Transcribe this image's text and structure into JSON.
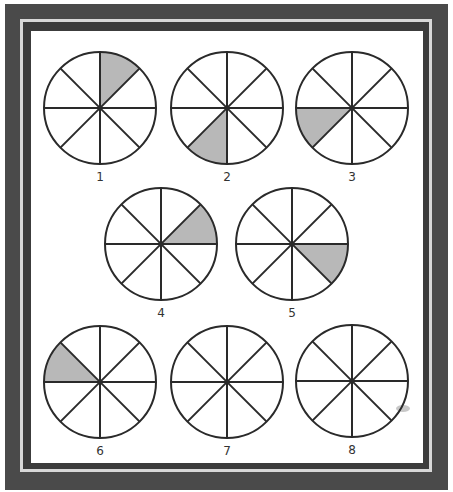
{
  "colors": {
    "frame_dark": "#4a4a4a",
    "frame_light": "#d8d8d8",
    "line": "#2a2a2a",
    "shade": "#b8b8b8",
    "background": "#ffffff"
  },
  "circles": [
    {
      "label": "1",
      "cx": 100,
      "cy": 108,
      "r": 56,
      "shaded_from": 45,
      "shaded_to": 90
    },
    {
      "label": "2",
      "cx": 227,
      "cy": 108,
      "r": 56,
      "shaded_from": 225,
      "shaded_to": 270
    },
    {
      "label": "3",
      "cx": 352,
      "cy": 108,
      "r": 56,
      "shaded_from": 180,
      "shaded_to": 225
    },
    {
      "label": "4",
      "cx": 161,
      "cy": 244,
      "r": 56,
      "shaded_from": 0,
      "shaded_to": 45
    },
    {
      "label": "5",
      "cx": 292,
      "cy": 244,
      "r": 56,
      "shaded_from": -45,
      "shaded_to": 0
    },
    {
      "label": "6",
      "cx": 100,
      "cy": 382,
      "r": 56,
      "shaded_from": 135,
      "shaded_to": 180
    },
    {
      "label": "7",
      "cx": 227,
      "cy": 382,
      "r": 56,
      "shaded_from": null,
      "shaded_to": null
    },
    {
      "label": "8",
      "cx": 352,
      "cy": 381,
      "r": 56,
      "shaded_from": null,
      "shaded_to": null
    }
  ],
  "divisions": 8
}
